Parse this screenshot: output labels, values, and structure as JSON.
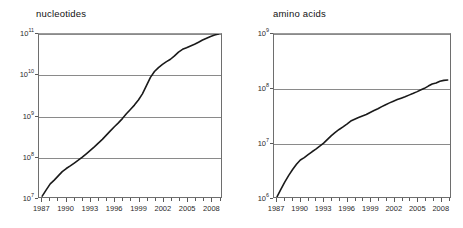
{
  "chart_data": [
    {
      "id": "nucleotides",
      "type": "line",
      "title": "nucleotides",
      "xlabel": "",
      "ylabel": "",
      "yscale": "log",
      "xlim": [
        1986.6,
        2009.3
      ],
      "ylim": [
        10000000,
        100000000000
      ],
      "ytick_labels": [
        "10",
        "10",
        "10",
        "10",
        "10"
      ],
      "ytick_exponents": [
        "7",
        "8",
        "9",
        "10",
        "11"
      ],
      "ytick_values": [
        10000000,
        100000000,
        1000000000,
        10000000000,
        100000000000
      ],
      "xtick_labels": [
        "1987",
        "1990",
        "1993",
        "1996",
        "1999",
        "2002",
        "2005",
        "2008"
      ],
      "xtick_values": [
        1987,
        1990,
        1993,
        1996,
        1999,
        2002,
        2005,
        2008
      ],
      "grid": "horizontal",
      "legend": "none",
      "series": [
        {
          "name": "GenBank nucleotides",
          "color": "#1a1a1a",
          "x": [
            1987.0,
            1987.5,
            1988.0,
            1988.5,
            1989.0,
            1989.5,
            1990.0,
            1990.5,
            1991.0,
            1991.5,
            1992.0,
            1992.5,
            1993.0,
            1993.5,
            1994.0,
            1994.5,
            1995.0,
            1995.5,
            1996.0,
            1996.5,
            1997.0,
            1997.5,
            1998.0,
            1998.5,
            1999.0,
            1999.5,
            2000.0,
            2000.5,
            2001.0,
            2001.5,
            2002.0,
            2002.5,
            2003.0,
            2003.5,
            2004.0,
            2004.5,
            2005.0,
            2005.5,
            2006.0,
            2006.5,
            2007.0,
            2007.5,
            2008.0,
            2008.5,
            2009.0
          ],
          "y": [
            10500000.0,
            15000000.0,
            21000000.0,
            26000000.0,
            33000000.0,
            42000000.0,
            50000000.0,
            58000000.0,
            68000000.0,
            80000000.0,
            95000000.0,
            115000000.0,
            140000000.0,
            170000000.0,
            210000000.0,
            260000000.0,
            330000000.0,
            420000000.0,
            530000000.0,
            660000000.0,
            840000000.0,
            1100000000.0,
            1400000000.0,
            1800000000.0,
            2400000000.0,
            3400000000.0,
            5400000000.0,
            8600000000.0,
            12000000000.0,
            15000000000.0,
            18000000000.0,
            21000000000.0,
            24000000000.0,
            29000000000.0,
            36000000000.0,
            42000000000.0,
            46000000000.0,
            51000000000.0,
            56000000000.0,
            63000000000.0,
            71000000000.0,
            79000000000.0,
            87000000000.0,
            94000000000.0,
            100000000000.0
          ]
        }
      ]
    },
    {
      "id": "amino-acids",
      "type": "line",
      "title": "amino acids",
      "xlabel": "",
      "ylabel": "",
      "yscale": "log",
      "xlim": [
        1986.6,
        2009.3
      ],
      "ylim": [
        1000000,
        1000000000
      ],
      "ytick_labels": [
        "10",
        "10",
        "10",
        "10"
      ],
      "ytick_exponents": [
        "6",
        "7",
        "8",
        "9"
      ],
      "ytick_values": [
        1000000,
        10000000,
        100000000,
        1000000000
      ],
      "xtick_labels": [
        "1987",
        "1990",
        "1993",
        "1996",
        "1999",
        "2002",
        "2005",
        "2008"
      ],
      "xtick_values": [
        1987,
        1990,
        1993,
        1996,
        1999,
        2002,
        2005,
        2008
      ],
      "grid": "horizontal",
      "legend": "none",
      "series": [
        {
          "name": "Protein database amino acids",
          "color": "#1a1a1a",
          "x": [
            1987.0,
            1987.5,
            1988.0,
            1988.5,
            1989.0,
            1989.5,
            1990.0,
            1990.5,
            1991.0,
            1991.5,
            1992.0,
            1992.5,
            1993.0,
            1993.5,
            1994.0,
            1994.5,
            1995.0,
            1995.5,
            1996.0,
            1996.5,
            1997.0,
            1997.5,
            1998.0,
            1998.5,
            1999.0,
            1999.5,
            2000.0,
            2000.5,
            2001.0,
            2001.5,
            2002.0,
            2002.5,
            2003.0,
            2003.5,
            2004.0,
            2004.5,
            2005.0,
            2005.5,
            2006.0,
            2006.5,
            2007.0,
            2007.5,
            2008.0,
            2008.5,
            2009.0
          ],
          "y": [
            1020000.0,
            1400000.0,
            1900000.0,
            2500000.0,
            3200000.0,
            4000000.0,
            4800000.0,
            5300000.0,
            6000000.0,
            6800000.0,
            7600000.0,
            8600000.0,
            9800000.0,
            11500000.0,
            13500000.0,
            15500000.0,
            17500000.0,
            19500000.0,
            22000000.0,
            25000000.0,
            27000000.0,
            29000000.0,
            31000000.0,
            33000000.0,
            36000000.0,
            39000000.0,
            42000000.0,
            46000000.0,
            50000000.0,
            54000000.0,
            58000000.0,
            62000000.0,
            66000000.0,
            70000000.0,
            75000000.0,
            80000000.0,
            86000000.0,
            93000000.0,
            100000000.0,
            110000000.0,
            120000000.0,
            125000000.0,
            135000000.0,
            140000000.0,
            142000000.0
          ]
        }
      ]
    }
  ],
  "colors": {
    "curve": "#1a1a1a",
    "gridline": "#8a8a8a",
    "frame": "#6e6e6e",
    "text": "#1a1a1a",
    "background": "#ffffff"
  }
}
